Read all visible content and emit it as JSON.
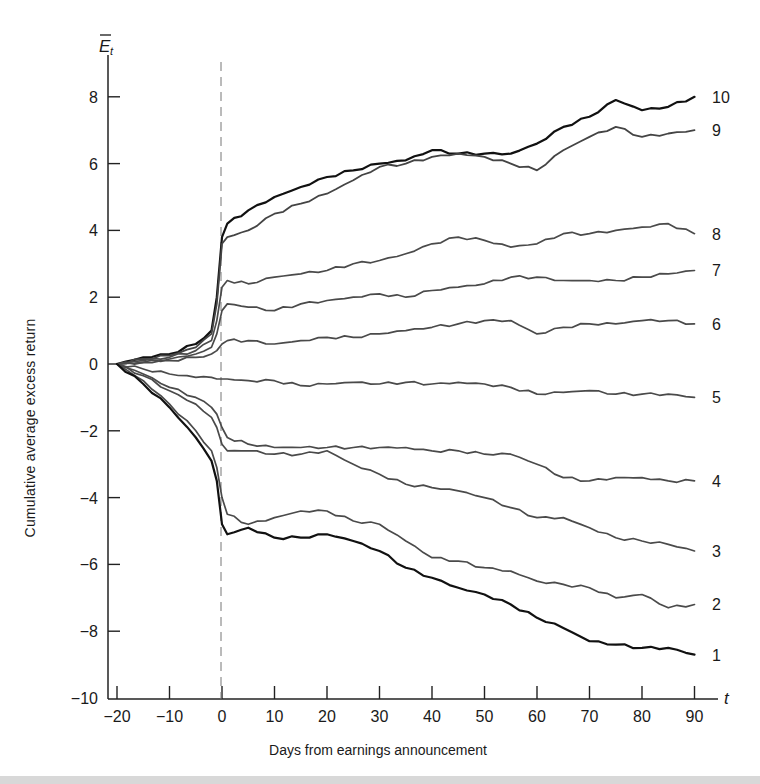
{
  "chart_data": {
    "type": "line",
    "title": "",
    "xlabel": "Days from earnings announcement",
    "ylabel": "Cumulative average excess return",
    "y_axis_symbol": "E̅",
    "y_axis_subscript": "t",
    "x_axis_symbol": "t",
    "xlim": [
      -20,
      90
    ],
    "ylim": [
      -10,
      9
    ],
    "x_ticks": [
      -20,
      -10,
      0,
      10,
      20,
      30,
      40,
      50,
      60,
      70,
      80,
      90
    ],
    "y_ticks": [
      8,
      6,
      4,
      2,
      0,
      -2,
      -4,
      -6,
      -8,
      -10
    ],
    "grid": false,
    "legend": "end-of-line labels",
    "vertical_reference_line": {
      "x": 0,
      "style": "dashed"
    },
    "x": [
      -20,
      -15,
      -10,
      -5,
      -2,
      -1,
      0,
      1,
      5,
      10,
      15,
      20,
      25,
      30,
      35,
      40,
      45,
      50,
      55,
      60,
      65,
      70,
      75,
      80,
      85,
      90
    ],
    "series": [
      {
        "name": "10",
        "color": "#111111",
        "width": 2.2,
        "values": [
          0,
          0.2,
          0.3,
          0.6,
          1.0,
          2.0,
          3.8,
          4.2,
          4.6,
          5.0,
          5.3,
          5.6,
          5.8,
          6.0,
          6.1,
          6.4,
          6.3,
          6.3,
          6.3,
          6.6,
          7.1,
          7.4,
          7.9,
          7.6,
          7.7,
          8.0
        ]
      },
      {
        "name": "9",
        "color": "#444444",
        "width": 1.8,
        "values": [
          0,
          0.15,
          0.25,
          0.5,
          0.9,
          1.8,
          3.6,
          3.8,
          4.0,
          4.5,
          4.8,
          5.1,
          5.5,
          5.9,
          6.0,
          6.2,
          6.3,
          6.2,
          6.0,
          5.8,
          6.4,
          6.8,
          7.1,
          6.8,
          6.9,
          7.0
        ]
      },
      {
        "name": "8",
        "color": "#4a4a4a",
        "width": 1.7,
        "values": [
          0,
          0.1,
          0.2,
          0.4,
          0.7,
          1.3,
          2.3,
          2.5,
          2.4,
          2.6,
          2.7,
          2.8,
          3.0,
          3.1,
          3.3,
          3.6,
          3.8,
          3.7,
          3.5,
          3.6,
          3.9,
          3.9,
          4.0,
          4.1,
          4.2,
          3.9
        ]
      },
      {
        "name": "7",
        "color": "#4a4a4a",
        "width": 1.7,
        "values": [
          0,
          0.05,
          0.15,
          0.3,
          0.5,
          0.9,
          1.6,
          1.8,
          1.7,
          1.6,
          1.8,
          1.9,
          2.0,
          2.1,
          2.0,
          2.2,
          2.3,
          2.4,
          2.6,
          2.6,
          2.5,
          2.5,
          2.5,
          2.6,
          2.7,
          2.8
        ]
      },
      {
        "name": "6",
        "color": "#4a4a4a",
        "width": 1.7,
        "values": [
          0,
          0.05,
          0.1,
          0.2,
          0.3,
          0.4,
          0.6,
          0.7,
          0.7,
          0.6,
          0.7,
          0.8,
          0.8,
          0.9,
          1.0,
          1.1,
          1.2,
          1.3,
          1.3,
          0.9,
          1.1,
          1.2,
          1.2,
          1.3,
          1.3,
          1.2
        ]
      },
      {
        "name": "5",
        "color": "#4a4a4a",
        "width": 1.7,
        "values": [
          0,
          -0.15,
          -0.3,
          -0.4,
          -0.4,
          -0.45,
          -0.45,
          -0.45,
          -0.5,
          -0.5,
          -0.65,
          -0.6,
          -0.55,
          -0.6,
          -0.55,
          -0.6,
          -0.55,
          -0.6,
          -0.7,
          -0.9,
          -0.85,
          -0.8,
          -0.9,
          -0.9,
          -0.9,
          -1.0
        ]
      },
      {
        "name": "4",
        "color": "#4a4a4a",
        "width": 1.7,
        "values": [
          0,
          -0.3,
          -0.7,
          -1.0,
          -1.3,
          -1.5,
          -1.9,
          -2.2,
          -2.4,
          -2.5,
          -2.5,
          -2.5,
          -2.5,
          -2.5,
          -2.5,
          -2.6,
          -2.6,
          -2.7,
          -2.7,
          -3.0,
          -3.4,
          -3.5,
          -3.4,
          -3.4,
          -3.5,
          -3.5
        ]
      },
      {
        "name": "3",
        "color": "#4a4a4a",
        "width": 1.7,
        "values": [
          0,
          -0.35,
          -0.8,
          -1.2,
          -1.6,
          -1.9,
          -2.4,
          -2.6,
          -2.6,
          -2.7,
          -2.7,
          -2.6,
          -3.0,
          -3.3,
          -3.6,
          -3.7,
          -3.8,
          -4.0,
          -4.3,
          -4.6,
          -4.6,
          -4.9,
          -5.2,
          -5.3,
          -5.4,
          -5.6
        ]
      },
      {
        "name": "2",
        "color": "#4a4a4a",
        "width": 1.7,
        "values": [
          0,
          -0.5,
          -1.2,
          -2.0,
          -2.6,
          -3.1,
          -4.0,
          -4.5,
          -4.8,
          -4.6,
          -4.4,
          -4.4,
          -4.7,
          -4.8,
          -5.3,
          -5.8,
          -5.9,
          -6.1,
          -6.2,
          -6.5,
          -6.6,
          -6.7,
          -7.0,
          -6.9,
          -7.3,
          -7.2
        ]
      },
      {
        "name": "1",
        "color": "#111111",
        "width": 2.2,
        "values": [
          0,
          -0.6,
          -1.3,
          -2.2,
          -2.9,
          -3.5,
          -4.8,
          -5.1,
          -4.9,
          -5.2,
          -5.2,
          -5.1,
          -5.3,
          -5.6,
          -6.1,
          -6.4,
          -6.7,
          -6.9,
          -7.2,
          -7.6,
          -7.9,
          -8.3,
          -8.4,
          -8.5,
          -8.5,
          -8.7
        ]
      }
    ]
  }
}
